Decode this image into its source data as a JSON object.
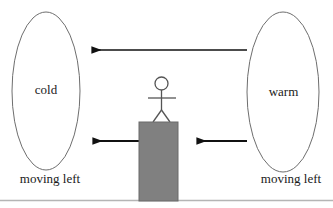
{
  "diagram": {
    "background_color": "#ffffff",
    "stroke_color": "#1a1a1a",
    "block_fill_color": "#808080",
    "ground_line_color": "#b0b0b0"
  },
  "regions": [
    {
      "id": "cold-region",
      "label": "cold",
      "shape": "ellipse",
      "cx": 46,
      "cy": 91,
      "rx": 34,
      "ry": 79
    },
    {
      "id": "warm-region",
      "label": "warm",
      "shape": "ellipse",
      "cx": 283,
      "cy": 92,
      "rx": 36,
      "ry": 80
    }
  ],
  "captions": [
    {
      "id": "cold-caption",
      "text": "moving left"
    },
    {
      "id": "warm-caption",
      "text": "moving left"
    }
  ],
  "arrows": [
    {
      "id": "top-arrow",
      "direction": "left",
      "from_x": 247,
      "to_x": 81,
      "y": 50,
      "description": "warm to cold, upper"
    },
    {
      "id": "middle-right-arrow",
      "direction": "left",
      "from_x": 247,
      "to_x": 186,
      "y": 141,
      "description": "warm to observer"
    },
    {
      "id": "middle-left-arrow",
      "direction": "left",
      "from_x": 139,
      "to_x": 82,
      "y": 141,
      "description": "observer to cold"
    }
  ],
  "figure": {
    "id": "stick-figure",
    "head_cx": 161.5,
    "head_cy": 83.5,
    "head_r": 6.5,
    "body_top": 90,
    "body_bottom": 110,
    "arms_y": 98,
    "arms_left_x": 148,
    "arms_right_x": 176,
    "leg_left_x": 153,
    "leg_right_x": 170,
    "leg_bottom_y": 122
  },
  "block": {
    "id": "platform-block",
    "x": 139,
    "y": 122,
    "width": 39,
    "height": 79
  },
  "ground": {
    "id": "ground-line",
    "y": 200,
    "x1": 0,
    "x2": 333
  }
}
